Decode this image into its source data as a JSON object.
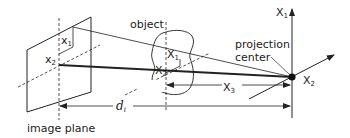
{
  "diagram": {
    "labels": {
      "object": "object",
      "projection_center": [
        "projection",
        "center"
      ],
      "image_plane": "image plane",
      "image_x1": {
        "base": "x",
        "sub": "1"
      },
      "image_x2": {
        "base": "x",
        "sub": "2"
      },
      "object_X1": {
        "base": "X",
        "sub": "1"
      },
      "object_X2": {
        "base": "X",
        "sub": "2"
      },
      "axis_X1": {
        "base": "X",
        "sub": "1"
      },
      "axis_X2": {
        "base": "X",
        "sub": "2"
      },
      "axis_X3": {
        "base": "X",
        "sub": "3"
      },
      "distance": {
        "base": "d",
        "sub": "i"
      }
    },
    "colors": {
      "stroke": "#222222",
      "background": "#ffffff"
    }
  }
}
